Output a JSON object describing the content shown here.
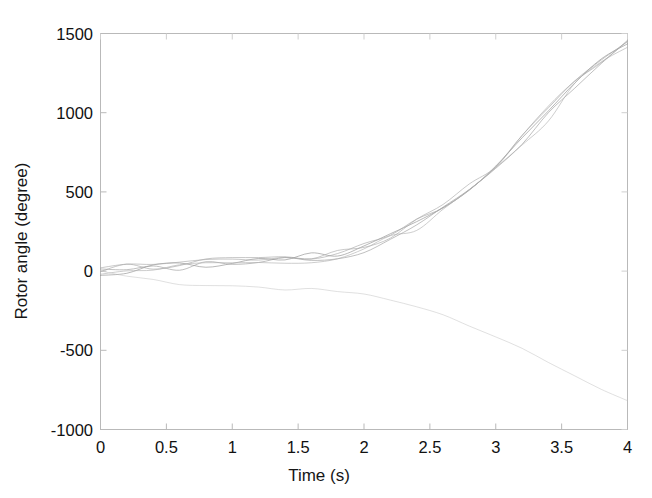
{
  "figure": {
    "background_color": "#ffffff",
    "axes_color": "#b9b9b9",
    "trace_color": "#9a9a9a"
  },
  "chart_data": {
    "type": "line",
    "title": "",
    "xlabel": "Time (s)",
    "ylabel": "Rotor angle (degree)",
    "xlim": [
      0,
      4
    ],
    "ylim": [
      -1000,
      1500
    ],
    "xticks": [
      "0",
      "0.5",
      "1",
      "1.5",
      "2",
      "2.5",
      "3",
      "3.5",
      "4"
    ],
    "xtick_values": [
      0,
      0.5,
      1,
      1.5,
      2,
      2.5,
      3,
      3.5,
      4
    ],
    "yticks": [
      "1500",
      "1000",
      "500",
      "0",
      "-500",
      "-1000"
    ],
    "ytick_values": [
      1500,
      1000,
      500,
      0,
      -500,
      -1000
    ],
    "grid": false,
    "legend": null,
    "legend_position": "none",
    "x": [
      0,
      0.2,
      0.4,
      0.6,
      0.8,
      1.0,
      1.2,
      1.4,
      1.6,
      1.8,
      2.0,
      2.2,
      2.4,
      2.6,
      2.8,
      3.0,
      3.2,
      3.4,
      3.6,
      3.8,
      4.0
    ],
    "series": [
      {
        "name": "rotor-angle-trace-1",
        "color": "#8e8e8e",
        "values": [
          0,
          12,
          26,
          40,
          52,
          62,
          70,
          78,
          90,
          112,
          150,
          215,
          300,
          400,
          520,
          660,
          820,
          1000,
          1180,
          1330,
          1450
        ]
      },
      {
        "name": "rotor-angle-trace-2",
        "color": "#9c9c9c",
        "values": [
          0,
          8,
          20,
          33,
          44,
          54,
          62,
          70,
          82,
          104,
          142,
          205,
          288,
          386,
          505,
          645,
          805,
          985,
          1168,
          1322,
          1445
        ]
      },
      {
        "name": "rotor-angle-trace-3",
        "color": "#a5a5a5",
        "values": [
          0,
          16,
          32,
          47,
          58,
          68,
          76,
          84,
          96,
          120,
          160,
          226,
          312,
          412,
          532,
          672,
          832,
          1010,
          1188,
          1336,
          1452
        ]
      },
      {
        "name": "rotor-angle-trace-4",
        "color": "#b0b0b0",
        "values": [
          0,
          4,
          14,
          26,
          36,
          45,
          52,
          60,
          72,
          95,
          133,
          196,
          278,
          376,
          494,
          634,
          794,
          974,
          1158,
          1315,
          1440
        ]
      },
      {
        "name": "rotor-angle-trace-5",
        "color": "#aaaaaa",
        "values": [
          0,
          20,
          38,
          54,
          66,
          76,
          84,
          92,
          104,
          128,
          168,
          234,
          320,
          420,
          540,
          680,
          840,
          1018,
          1195,
          1340,
          1455
        ]
      },
      {
        "name": "rotor-angle-trace-lower",
        "color": "#bdbdbd",
        "values": [
          0,
          -30,
          -58,
          -78,
          -90,
          -98,
          -104,
          -110,
          -118,
          -128,
          -142,
          -175,
          -225,
          -285,
          -350,
          -420,
          -495,
          -575,
          -655,
          -738,
          -820
        ]
      }
    ]
  }
}
